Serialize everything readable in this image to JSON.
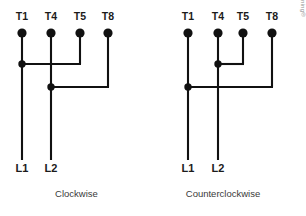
{
  "figure": {
    "background_color": "#ffffff",
    "wire_color": "#111111",
    "label_color": "#1b1b1b",
    "caption_color": "#3a3a3a"
  },
  "diagrams": [
    {
      "id": "clockwise",
      "caption": "Clockwise",
      "terminals": [
        {
          "label": "T1",
          "x": 22
        },
        {
          "label": "T4",
          "x": 51
        },
        {
          "label": "T5",
          "x": 80
        },
        {
          "label": "T8",
          "x": 108
        }
      ],
      "junctions": [
        {
          "name": "upper-junction-t1",
          "x": 22,
          "y": 64,
          "connects_to": "T5"
        },
        {
          "name": "lower-junction-t4",
          "x": 51,
          "y": 87,
          "connects_to": "T8"
        }
      ],
      "supply_lines": [
        {
          "label": "L1",
          "x": 22
        },
        {
          "label": "L2",
          "x": 51
        }
      ]
    },
    {
      "id": "counterclockwise",
      "caption": "Counterclockwise",
      "terminals": [
        {
          "label": "T1",
          "x": 35
        },
        {
          "label": "T4",
          "x": 65
        },
        {
          "label": "T5",
          "x": 90
        },
        {
          "label": "T8",
          "x": 119
        }
      ],
      "junctions": [
        {
          "name": "upper-junction-t4",
          "x": 65,
          "y": 64,
          "connects_to": "T5"
        },
        {
          "name": "lower-junction-t1",
          "x": 35,
          "y": 87,
          "connects_to": "T8"
        }
      ],
      "supply_lines": [
        {
          "label": "L1",
          "x": 35
        },
        {
          "label": "L2",
          "x": 65
        }
      ]
    }
  ],
  "copyright": "Copyright © 2015 Cengage Learning®"
}
